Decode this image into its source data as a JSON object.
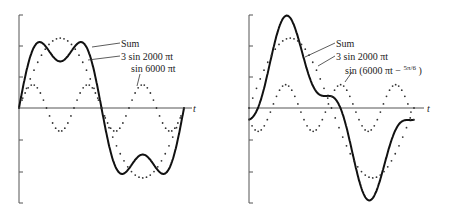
{
  "chart_data": [
    {
      "type": "line",
      "title": "",
      "xlabel": "t",
      "ylabel": "",
      "legend": [
        "Sum",
        "3 sin 2000 πt",
        "sin 6000 πt"
      ],
      "series": [
        {
          "name": "Sum",
          "style": "solid",
          "formula": "3 sin(2000πt) + sin(6000πt)"
        },
        {
          "name": "3 sin 2000 πt",
          "style": "dotted",
          "formula": "3 sin(2000πt)"
        },
        {
          "name": "sin 6000 πt",
          "style": "dotted",
          "formula": "sin(6000πt)"
        }
      ],
      "x_range_periods": [
        0,
        1
      ],
      "yticks_count": 7
    },
    {
      "type": "line",
      "title": "",
      "xlabel": "t",
      "ylabel": "",
      "legend": [
        "Sum",
        "3 sin 2000 πt",
        "sin (6000 πt − 5π/6)"
      ],
      "series": [
        {
          "name": "Sum",
          "style": "solid",
          "formula": "3 sin(2000πt) + sin(6000πt − 5π/6)"
        },
        {
          "name": "3 sin 2000 πt",
          "style": "dotted",
          "formula": "3 sin(2000πt)"
        },
        {
          "name": "sin (6000 πt − 5π/6)",
          "style": "dotted",
          "formula": "sin(6000πt − 5π/6)"
        }
      ],
      "x_range_periods": [
        0,
        1
      ],
      "yticks_count": 7
    }
  ],
  "left": {
    "axis_label": "t",
    "sum_label": "Sum",
    "fund_label": "3 sin 2000 πt",
    "harm_label": "sin 6000 πt"
  },
  "right": {
    "axis_label": "t",
    "sum_label": "Sum",
    "fund_label": "3 sin 2000 πt",
    "harm_label": "sin (6000 πt − ",
    "harm_phase": "5π/6",
    "harm_close": " )"
  }
}
